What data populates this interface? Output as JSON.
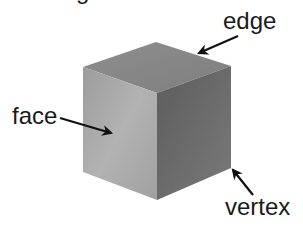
{
  "figure": {
    "partial_heading_fragment": "g",
    "labels": {
      "edge": "edge",
      "face": "face",
      "vertex": "vertex"
    },
    "shape": "cube",
    "colors": {
      "top_face": "#8a8a8a",
      "left_face": "#a9a9a9",
      "right_face": "#6a6a6a",
      "arrow": "#111111",
      "text": "#1a1a1a",
      "background": "#ffffff"
    }
  }
}
